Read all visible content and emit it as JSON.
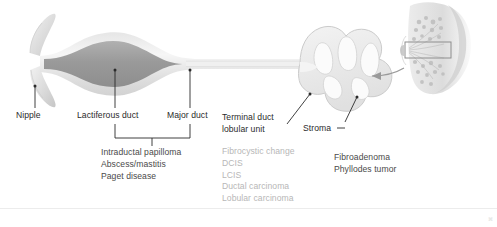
{
  "figure": {
    "type": "anatomical-diagram"
  },
  "labels": {
    "nipple": "Nipple",
    "lactiferous_duct": "Lactiferous duct",
    "major_duct": "Major duct",
    "terminal_duct_line1": "Terminal duct",
    "terminal_duct_line2": "lobular unit",
    "stroma": "Stroma"
  },
  "lesion_lists": {
    "duct_group": {
      "items": [
        "Intraductal papilloma",
        "Abscess/mastitis",
        "Paget disease"
      ]
    },
    "tdlu_group": {
      "items": [
        "Fibrocystic change",
        "DCIS",
        "LCIS",
        "Ductal carcinoma",
        "Lobular carcinoma"
      ]
    },
    "stroma_group": {
      "items": [
        "Fibroadenoma",
        "Phyllodes tumor"
      ]
    }
  },
  "colors": {
    "duct_wall": "#e2e2e2",
    "duct_lumen": "#f4f4f4",
    "sinus_fill": "#9e9e9e",
    "lobule_fill": "#ededed",
    "lobule_stroke": "#cfcfcf",
    "leader_line": "#2b2b2b",
    "grey_text": "#b7b7b7",
    "dark_text": "#3a3a3a",
    "inset_tissue": "#d7d7d7"
  },
  "inset": {
    "name": "breast-cross-section",
    "callout_box": "magnified-region",
    "arrow_direction": "left"
  },
  "corner_mark": "⌘"
}
